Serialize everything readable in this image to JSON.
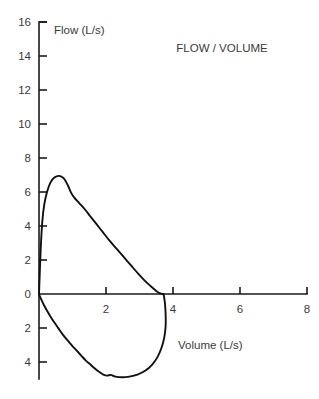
{
  "chart_data": {
    "type": "line",
    "title": "FLOW / VOLUME",
    "xlabel": "Volume (L/s)",
    "ylabel": "Flow (L/s)",
    "xlim": [
      0,
      8
    ],
    "ylim": [
      -5,
      16
    ],
    "grid": false,
    "legend": "none",
    "x_ticks": [
      2,
      4,
      6,
      8
    ],
    "x_tick_labels": [
      "2",
      "4",
      "6",
      "8"
    ],
    "y_ticks": [
      16,
      14,
      12,
      10,
      8,
      6,
      4,
      2,
      0,
      -2,
      -4
    ],
    "y_tick_labels": [
      "16",
      "14",
      "12",
      "10",
      "8",
      "6",
      "4",
      "2",
      "0",
      "2",
      "4"
    ],
    "series": [
      {
        "name": "Expiratory limb",
        "points": [
          [
            0.0,
            0.0
          ],
          [
            0.05,
            2.6
          ],
          [
            0.1,
            4.3
          ],
          [
            0.16,
            5.3
          ],
          [
            0.24,
            6.0
          ],
          [
            0.34,
            6.55
          ],
          [
            0.46,
            6.85
          ],
          [
            0.6,
            6.95
          ],
          [
            0.74,
            6.8
          ],
          [
            0.86,
            6.4
          ],
          [
            0.96,
            5.95
          ],
          [
            1.06,
            5.65
          ],
          [
            1.2,
            5.35
          ],
          [
            1.36,
            5.0
          ],
          [
            1.52,
            4.6
          ],
          [
            1.7,
            4.15
          ],
          [
            1.9,
            3.65
          ],
          [
            2.1,
            3.15
          ],
          [
            2.32,
            2.65
          ],
          [
            2.54,
            2.15
          ],
          [
            2.76,
            1.65
          ],
          [
            2.96,
            1.2
          ],
          [
            3.14,
            0.82
          ],
          [
            3.3,
            0.52
          ],
          [
            3.44,
            0.28
          ],
          [
            3.54,
            0.12
          ],
          [
            3.62,
            0.04
          ],
          [
            3.7,
            0.0
          ]
        ]
      },
      {
        "name": "Inspiratory limb",
        "points": [
          [
            3.72,
            0.0
          ],
          [
            3.76,
            -0.55
          ],
          [
            3.78,
            -1.2
          ],
          [
            3.78,
            -1.9
          ],
          [
            3.74,
            -2.55
          ],
          [
            3.66,
            -3.15
          ],
          [
            3.54,
            -3.7
          ],
          [
            3.38,
            -4.15
          ],
          [
            3.18,
            -4.5
          ],
          [
            2.94,
            -4.74
          ],
          [
            2.7,
            -4.86
          ],
          [
            2.48,
            -4.9
          ],
          [
            2.28,
            -4.86
          ],
          [
            2.14,
            -4.76
          ],
          [
            2.04,
            -4.8
          ],
          [
            1.92,
            -4.74
          ],
          [
            1.78,
            -4.56
          ],
          [
            1.64,
            -4.34
          ],
          [
            1.52,
            -4.12
          ],
          [
            1.4,
            -3.92
          ],
          [
            1.26,
            -3.62
          ],
          [
            1.12,
            -3.32
          ],
          [
            0.98,
            -3.02
          ],
          [
            0.84,
            -2.7
          ],
          [
            0.7,
            -2.36
          ],
          [
            0.58,
            -2.02
          ],
          [
            0.46,
            -1.68
          ],
          [
            0.34,
            -1.32
          ],
          [
            0.24,
            -0.98
          ],
          [
            0.15,
            -0.66
          ],
          [
            0.08,
            -0.38
          ],
          [
            0.03,
            -0.16
          ],
          [
            0.0,
            0.0
          ]
        ]
      }
    ]
  }
}
